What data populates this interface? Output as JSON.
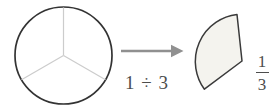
{
  "figure": {
    "type": "fraction-division-diagram",
    "whole_circle_parts": 3,
    "extracted_parts": 1,
    "expression": "1 ÷ 3",
    "fraction": {
      "numerator": "1",
      "denominator": "3"
    }
  },
  "colors": {
    "background": "#ffffff",
    "circle_outline": "#333333",
    "divider_lines": "#cccccc",
    "arrow": "#909090",
    "sector_fill": "#f4f3ee",
    "sector_outline": "#3a3a3a",
    "text": "#4d4d4d"
  }
}
